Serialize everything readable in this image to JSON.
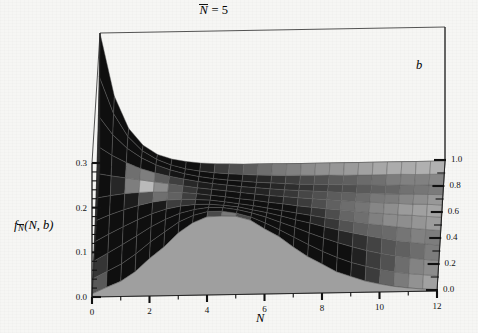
{
  "figure": {
    "title_prefix": "N",
    "title_suffix": " = 5",
    "title_full": "N̄ = 5",
    "background_color": "#f6f6f4",
    "surface_color": "#b2b2b2",
    "mesh_color": "#5d5d5d",
    "axis_color": "#111111"
  },
  "axes": {
    "x": {
      "label": "N",
      "min": 0,
      "max": 12,
      "ticks": [
        "0",
        "2",
        "4",
        "6",
        "8",
        "10",
        "12"
      ],
      "tick_values": [
        0,
        2,
        4,
        6,
        8,
        10,
        12
      ],
      "minor_per_interval": 1
    },
    "y": {
      "label": "b",
      "min": 0,
      "max": 1,
      "ticks": [
        "0.0",
        "0.2",
        "0.4",
        "0.6",
        "0.8",
        "1.0"
      ],
      "tick_values": [
        0,
        0.2,
        0.4,
        0.6,
        0.8,
        1.0
      ],
      "minor_per_interval": 1
    },
    "z": {
      "label_base": "f",
      "label_sub": "N",
      "label_args": "(N, b)",
      "label_full": "f̄N(N, b)",
      "min": 0,
      "max": 0.3,
      "ticks": [
        "0.0",
        "0.1",
        "0.2",
        "0.3"
      ],
      "tick_values": [
        0,
        0.1,
        0.2,
        0.3
      ],
      "minor_per_interval": 4
    }
  },
  "chart_data": {
    "type": "surface",
    "xlabel": "N",
    "ylabel": "b",
    "zlabel": "f_N̄(N, b)",
    "xlim": [
      0,
      12
    ],
    "ylim": [
      0,
      1
    ],
    "zlim": [
      0,
      0.3
    ],
    "grid": true,
    "legend": false,
    "x": [
      0,
      0.5,
      1,
      1.5,
      2,
      2.5,
      3,
      3.5,
      4,
      4.5,
      5,
      5.5,
      6,
      6.5,
      7,
      7.5,
      8,
      8.5,
      9,
      9.5,
      10,
      10.5,
      11,
      11.5,
      12
    ],
    "y": [
      0,
      0.1,
      0.2,
      0.3,
      0.4,
      0.5,
      0.6,
      0.7,
      0.8,
      0.9,
      1.0
    ],
    "series": [
      {
        "name": "b=0.0",
        "values": [
          0.007,
          0.021,
          0.034,
          0.055,
          0.084,
          0.109,
          0.14,
          0.162,
          0.175,
          0.176,
          0.175,
          0.166,
          0.146,
          0.128,
          0.104,
          0.082,
          0.065,
          0.047,
          0.036,
          0.025,
          0.018,
          0.012,
          0.008,
          0.005,
          0.003
        ]
      },
      {
        "name": "b=0.1",
        "values": [
          0.012,
          0.028,
          0.044,
          0.066,
          0.092,
          0.114,
          0.136,
          0.15,
          0.158,
          0.158,
          0.153,
          0.144,
          0.13,
          0.114,
          0.097,
          0.08,
          0.064,
          0.05,
          0.038,
          0.029,
          0.021,
          0.015,
          0.011,
          0.008,
          0.005
        ]
      },
      {
        "name": "b=0.2",
        "values": [
          0.022,
          0.04,
          0.058,
          0.077,
          0.097,
          0.113,
          0.126,
          0.134,
          0.138,
          0.137,
          0.132,
          0.124,
          0.114,
          0.102,
          0.09,
          0.077,
          0.065,
          0.054,
          0.044,
          0.035,
          0.028,
          0.022,
          0.017,
          0.013,
          0.01
        ]
      },
      {
        "name": "b=0.3",
        "values": [
          0.036,
          0.053,
          0.069,
          0.084,
          0.097,
          0.107,
          0.113,
          0.116,
          0.116,
          0.113,
          0.109,
          0.102,
          0.095,
          0.087,
          0.078,
          0.07,
          0.061,
          0.053,
          0.046,
          0.039,
          0.033,
          0.027,
          0.023,
          0.019,
          0.015
        ]
      },
      {
        "name": "b=0.4",
        "values": [
          0.054,
          0.067,
          0.078,
          0.087,
          0.094,
          0.098,
          0.099,
          0.098,
          0.096,
          0.092,
          0.087,
          0.082,
          0.076,
          0.07,
          0.064,
          0.058,
          0.052,
          0.047,
          0.042,
          0.037,
          0.033,
          0.029,
          0.025,
          0.022,
          0.019
        ]
      },
      {
        "name": "b=0.5",
        "values": [
          0.076,
          0.081,
          0.085,
          0.087,
          0.088,
          0.087,
          0.085,
          0.082,
          0.078,
          0.074,
          0.069,
          0.065,
          0.06,
          0.056,
          0.051,
          0.047,
          0.043,
          0.04,
          0.036,
          0.033,
          0.03,
          0.027,
          0.025,
          0.022,
          0.02
        ]
      },
      {
        "name": "b=0.6",
        "values": [
          0.102,
          0.096,
          0.091,
          0.086,
          0.081,
          0.076,
          0.071,
          0.066,
          0.062,
          0.058,
          0.054,
          0.05,
          0.046,
          0.043,
          0.04,
          0.037,
          0.034,
          0.032,
          0.029,
          0.027,
          0.025,
          0.023,
          0.021,
          0.02,
          0.018
        ]
      },
      {
        "name": "b=0.7",
        "values": [
          0.134,
          0.113,
          0.096,
          0.082,
          0.072,
          0.064,
          0.057,
          0.051,
          0.046,
          0.042,
          0.038,
          0.035,
          0.032,
          0.029,
          0.027,
          0.025,
          0.023,
          0.021,
          0.019,
          0.018,
          0.016,
          0.015,
          0.014,
          0.013,
          0.012
        ]
      },
      {
        "name": "b=0.8",
        "values": [
          0.173,
          0.13,
          0.099,
          0.077,
          0.061,
          0.049,
          0.04,
          0.033,
          0.028,
          0.024,
          0.021,
          0.018,
          0.016,
          0.014,
          0.012,
          0.011,
          0.01,
          0.009,
          0.008,
          0.007,
          0.006,
          0.006,
          0.005,
          0.005,
          0.004
        ]
      },
      {
        "name": "b=0.9",
        "values": [
          0.232,
          0.148,
          0.096,
          0.064,
          0.044,
          0.031,
          0.022,
          0.016,
          0.012,
          0.009,
          0.007,
          0.005,
          0.004,
          0.003,
          0.003,
          0.002,
          0.002,
          0.001,
          0.001,
          0.001,
          0.001,
          0.001,
          0.0,
          0.0,
          0.0
        ]
      },
      {
        "name": "b=1.0",
        "values": [
          0.3,
          0.158,
          0.085,
          0.047,
          0.026,
          0.015,
          0.009,
          0.005,
          0.003,
          0.002,
          0.001,
          0.001,
          0.001,
          0.0,
          0.0,
          0.0,
          0.0,
          0.0,
          0.0,
          0.0,
          0.0,
          0.0,
          0.0,
          0.0,
          0.0
        ]
      }
    ]
  }
}
